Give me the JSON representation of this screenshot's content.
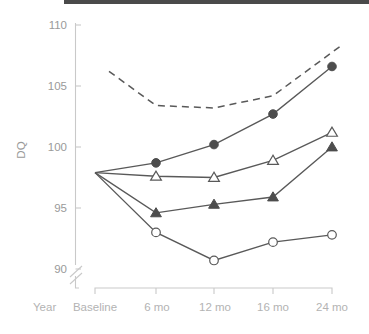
{
  "chart_data": {
    "type": "line",
    "title": "",
    "xlabel": "Year",
    "ylabel": "DQ",
    "x": [
      "Baseline",
      "6 mo",
      "12 mo",
      "16 mo",
      "24 mo"
    ],
    "categories": [
      "Baseline",
      "6 mo",
      "12 mo",
      "16 mo",
      "24 mo"
    ],
    "xticklabels": [
      "Baseline",
      "6 mo",
      "12 mo",
      "16 mo",
      "24 mo"
    ],
    "yticklabels": [
      "90",
      "95",
      "100",
      "105",
      "110"
    ],
    "yticks": [
      90,
      95,
      100,
      105,
      110
    ],
    "ylim": [
      89,
      110
    ],
    "y_axis_break": true,
    "grid": false,
    "legend": "none",
    "series": [
      {
        "name": "dashed-upper",
        "marker": "none",
        "linestyle": "dashed",
        "color": "#595959",
        "x": [
          "Baseline+",
          "6 mo",
          "12 mo",
          "16 mo",
          "24 mo"
        ],
        "values": [
          106.2,
          103.4,
          103.2,
          104.2,
          108.3
        ],
        "x_start_offset": "starts between Baseline and 6 mo"
      },
      {
        "name": "filled-circle",
        "marker": "filled-circle",
        "linestyle": "solid",
        "color": "#4d4d4d",
        "values": [
          97.9,
          98.7,
          100.2,
          102.7,
          106.6
        ]
      },
      {
        "name": "open-triangle",
        "marker": "open-triangle",
        "linestyle": "solid",
        "color": "#595959",
        "values": [
          97.9,
          97.6,
          97.5,
          98.9,
          101.2
        ]
      },
      {
        "name": "filled-triangle",
        "marker": "filled-triangle",
        "linestyle": "solid",
        "color": "#4d4d4d",
        "values": [
          97.9,
          94.6,
          95.3,
          95.9,
          100.0
        ]
      },
      {
        "name": "open-circle",
        "marker": "open-circle",
        "linestyle": "solid",
        "color": "#595959",
        "values": [
          97.9,
          93.0,
          90.7,
          92.2,
          92.8
        ]
      }
    ],
    "annotations": []
  },
  "axis": {
    "y_label": "DQ",
    "x_corner_label": "Year",
    "y_ticks": [
      "110",
      "105",
      "100",
      "95",
      "90"
    ],
    "x_ticks": [
      "Baseline",
      "6 mo",
      "12 mo",
      "16 mo",
      "24 mo"
    ]
  },
  "colors": {
    "line": "#595959",
    "marker_fill": "#4d4d4d",
    "axis": "#c9c9c9",
    "tick_text": "#9a9a9a",
    "x_tick_text": "#b3b3b3",
    "top_bar": "#4a4a4a",
    "background": "#ffffff"
  }
}
